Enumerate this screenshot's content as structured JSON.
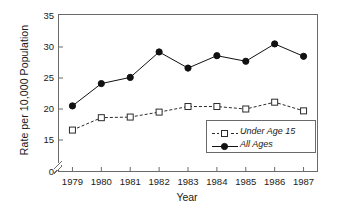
{
  "chart_data": {
    "type": "line",
    "title": "",
    "xlabel": "Year",
    "ylabel": "Rate per 10,000 Population",
    "x": [
      1979,
      1980,
      1981,
      1982,
      1983,
      1984,
      1985,
      1986,
      1987
    ],
    "xtick_labels": [
      "1979",
      "1980",
      "1981",
      "1982",
      "1983",
      "1984",
      "1985",
      "1986",
      "1987"
    ],
    "ytick_labels": [
      "0",
      "15",
      "20",
      "25",
      "30",
      "35"
    ],
    "ytick_values": [
      0,
      15,
      20,
      25,
      30,
      35
    ],
    "ylim": [
      0,
      35
    ],
    "axis_break": true,
    "axis_break_between": [
      0,
      15
    ],
    "grid": false,
    "legend_position": "inside-lower-right",
    "series": [
      {
        "name": "Under Age 15",
        "values": [
          16.6,
          18.6,
          18.7,
          19.5,
          20.4,
          20.4,
          20.0,
          21.1,
          19.7
        ],
        "marker": "open-square",
        "linestyle": "dashed",
        "color": "#2b2b2b"
      },
      {
        "name": "All Ages",
        "values": [
          20.5,
          24.1,
          25.1,
          29.2,
          26.6,
          28.6,
          27.7,
          30.5,
          28.5
        ],
        "marker": "filled-circle",
        "linestyle": "solid",
        "color": "#111111"
      }
    ]
  },
  "legend": {
    "entries": [
      {
        "label": "Under Age 15"
      },
      {
        "label": "All Ages"
      }
    ]
  },
  "colors": {
    "frame": "#6a6a6a",
    "text": "#1a1a1a",
    "series_all_ages": "#111111",
    "series_under_15": "#2b2b2b",
    "background": "#ffffff"
  }
}
